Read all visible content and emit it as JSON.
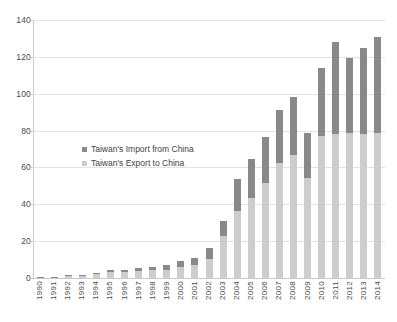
{
  "chart_data": {
    "type": "bar",
    "stacked": true,
    "title": "",
    "subtitle": "",
    "xlabel": "",
    "ylabel": "",
    "ylim": [
      0,
      140
    ],
    "ytick_step": 20,
    "yticks": [
      "140",
      "120",
      "100",
      "80",
      "60",
      "40",
      "20",
      "0"
    ],
    "grid": true,
    "legend_position": "inside-left",
    "categories": [
      "1990",
      "1991",
      "1992",
      "1993",
      "1994",
      "1995",
      "1996",
      "1997",
      "1998",
      "1999",
      "2000",
      "2001",
      "2002",
      "2003",
      "2004",
      "2005",
      "2006",
      "2007",
      "2008",
      "2009",
      "2010",
      "2011",
      "2012",
      "2013",
      "2014"
    ],
    "series": [
      {
        "name": "Taiwan's Export to China",
        "color": "#cdcdcd",
        "values": [
          0.3,
          0.6,
          1.1,
          1.4,
          2.2,
          3.1,
          3.3,
          3.9,
          4.1,
          4.5,
          6.2,
          6.8,
          10.5,
          22.9,
          36.3,
          43.6,
          51.8,
          62.4,
          66.9,
          54.2,
          76.9,
          78.4,
          78.6,
          78.4,
          78.7
        ]
      },
      {
        "name": "Taiwan's Import from China",
        "color": "#898989",
        "values": [
          0.1,
          0.2,
          0.3,
          0.4,
          0.6,
          1.1,
          1.2,
          1.7,
          1.9,
          2.5,
          3.2,
          4.1,
          5.8,
          8.0,
          17.7,
          21.0,
          24.9,
          28.6,
          31.6,
          24.6,
          37.1,
          49.6,
          41.0,
          46.6,
          52.3
        ]
      }
    ],
    "annotations": []
  },
  "legend": {
    "items": [
      {
        "label": "Taiwan's Import from China",
        "color": "#898989"
      },
      {
        "label": "Taiwan's Export to China",
        "color": "#cdcdcd"
      }
    ]
  }
}
